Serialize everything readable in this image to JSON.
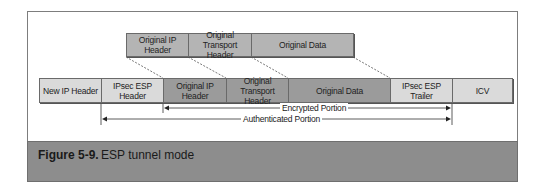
{
  "figure": {
    "number": "Figure 5-9.",
    "title": "ESP tunnel mode"
  },
  "original_packet": {
    "fields": [
      {
        "label": "Original IP Header",
        "l1": "Original IP",
        "l2": "Header"
      },
      {
        "label": "Original Transport Header",
        "l1": "Original",
        "l2": "Transport Header"
      },
      {
        "label": "Original Data",
        "l1": "Original Data",
        "l2": ""
      }
    ]
  },
  "esp_packet": {
    "fields": [
      {
        "label": "New IP Header",
        "l1": "New IP Header",
        "l2": ""
      },
      {
        "label": "IPsec ESP Header",
        "l1": "IPsec ESP",
        "l2": "Header"
      },
      {
        "label": "Original IP Header",
        "l1": "Original IP",
        "l2": "Header"
      },
      {
        "label": "Original Transport Header",
        "l1": "Original",
        "l2": "Transport Header"
      },
      {
        "label": "Original Data",
        "l1": "Original Data",
        "l2": ""
      },
      {
        "label": "IPsec ESP Trailer",
        "l1": "IPsec ESP Trailer",
        "l2": ""
      },
      {
        "label": "ICV",
        "l1": "ICV",
        "l2": ""
      }
    ]
  },
  "portions": {
    "encrypted": "Encrypted Portion",
    "authenticated": "Authenticated Portion"
  },
  "colors": {
    "light_field": "#dadada",
    "original_top_field": "#b4b4b4",
    "encapsulated_field": "#9b9b9b",
    "caption_band": "#8d8d8d"
  }
}
